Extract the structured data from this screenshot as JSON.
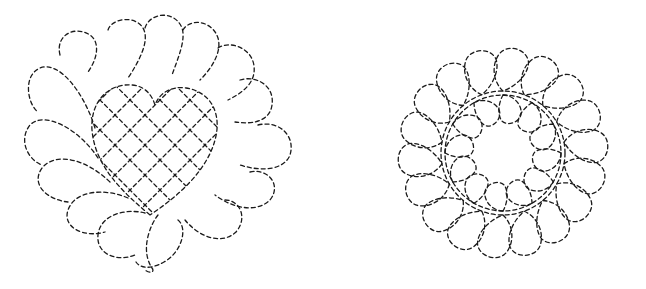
{
  "figure": {
    "background": "#ffffff",
    "line_color": "#1a1a1a",
    "motifs": [
      {
        "name": "feathered-heart-crosshatch",
        "center": [
          160,
          143
        ],
        "outer_radius": 125,
        "plume_count": 14,
        "center_fill": "crosshatch grid"
      },
      {
        "name": "feathered-wreath",
        "center": [
          503,
          153
        ],
        "outer_radius": 120,
        "inner_radius": 45,
        "outer_feathers": 18,
        "inner_feathers": 12
      }
    ]
  }
}
